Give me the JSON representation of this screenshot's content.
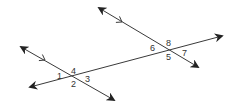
{
  "diagram": {
    "type": "parallel-lines-cut-by-transversal",
    "colors": {
      "line": "#3a3a3a",
      "text": "#333333",
      "background": "#ffffff"
    },
    "transversal": {
      "x1": 30,
      "y1": 87,
      "x2": 222,
      "y2": 36
    },
    "parallel_lines": [
      {
        "name": "left-parallel-line",
        "x1": 21,
        "y1": 47,
        "x2": 114,
        "y2": 100,
        "marker": {
          "x": 45,
          "y": 60
        }
      },
      {
        "name": "right-parallel-line",
        "x1": 99,
        "y1": 8,
        "x2": 198,
        "y2": 67,
        "marker": {
          "x": 122,
          "y": 22
        }
      }
    ],
    "intersections": [
      {
        "x": 72,
        "y": 77
      },
      {
        "x": 168,
        "y": 50
      }
    ],
    "angle_labels": [
      {
        "text": "1",
        "x": 57,
        "y": 79
      },
      {
        "text": "4",
        "x": 71,
        "y": 74
      },
      {
        "text": "2",
        "x": 71,
        "y": 87
      },
      {
        "text": "3",
        "x": 85,
        "y": 82
      },
      {
        "text": "6",
        "x": 150,
        "y": 51
      },
      {
        "text": "8",
        "x": 166,
        "y": 46
      },
      {
        "text": "5",
        "x": 166,
        "y": 60
      },
      {
        "text": "7",
        "x": 182,
        "y": 56
      }
    ]
  }
}
